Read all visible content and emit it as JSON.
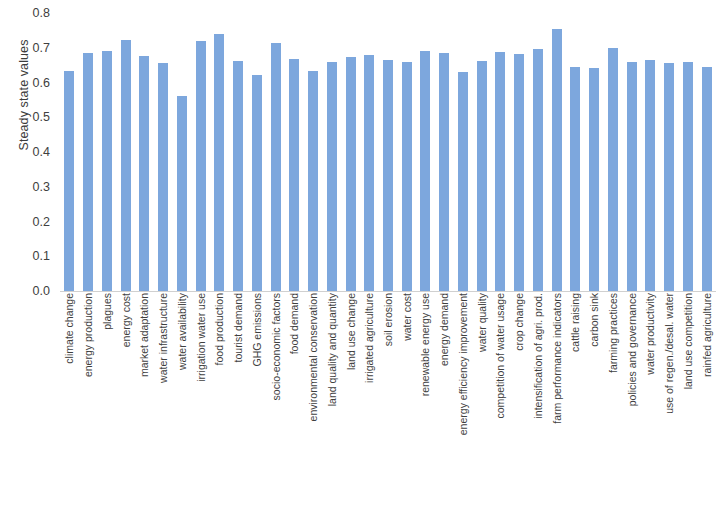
{
  "chart_data": {
    "type": "bar",
    "title": "",
    "xlabel": "",
    "ylabel": "Steady state values",
    "ylim": [
      0,
      0.8
    ],
    "ytick_labels": [
      "0.8",
      "0.7",
      "0.6",
      "0.5",
      "0.4",
      "0.3",
      "0.2",
      "0.1",
      "0.0"
    ],
    "ytick_values": [
      0.8,
      0.7,
      0.6,
      0.5,
      0.4,
      0.3,
      0.2,
      0.1,
      0.0
    ],
    "grid": false,
    "legend": false,
    "bar_color": "#7da7dd",
    "categories": [
      "climate change",
      "energy production",
      "plagues",
      "energy cost",
      "market adaptation",
      "water infrastructure",
      "water availability",
      "irrigation water use",
      "food production",
      "tourist demand",
      "GHG emissions",
      "socio-economic factors",
      "food demand",
      "environmental conservation",
      "land quality and quantity",
      "land use change",
      "irrigated agriculture",
      "soil erosion",
      "water cost",
      "renewable energy use",
      "energy demand",
      "energy efficiency improvement",
      "water quality",
      "competition of water usage",
      "crop change",
      "intensification of agri. prod.",
      "farm performance indicators",
      "cattle raising",
      "carbon sink",
      "farming practices",
      "policies and governance",
      "water productivity",
      "use of regen./desal. water",
      "land use competition",
      "rainfed agriculture"
    ],
    "values": [
      0.632,
      0.686,
      0.69,
      0.722,
      0.676,
      0.656,
      0.561,
      0.72,
      0.74,
      0.663,
      0.621,
      0.713,
      0.667,
      0.634,
      0.659,
      0.674,
      0.678,
      0.664,
      0.66,
      0.692,
      0.686,
      0.631,
      0.661,
      0.688,
      0.683,
      0.697,
      0.755,
      0.645,
      0.643,
      0.7,
      0.66,
      0.664,
      0.656,
      0.66,
      0.646
    ]
  }
}
